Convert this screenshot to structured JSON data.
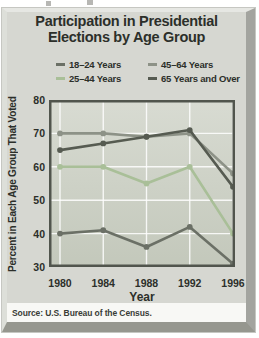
{
  "figure": {
    "title_line1": "Participation in Presidential",
    "title_line2": "Elections by Age Group",
    "source": "Source: U.S. Bureau of the Census.",
    "panel_color": "#d6d7d1",
    "plot_bg_top": "#d8dbd2",
    "plot_bg_bottom": "#c3c8bb",
    "plot_border_color": "#51554d",
    "grid_color": "#ffffff",
    "text_color": "#2c2f2a"
  },
  "legend": {
    "order": [
      0,
      2,
      1,
      3
    ]
  },
  "chart_data": {
    "type": "line",
    "title": "Participation in Presidential Elections by Age Group",
    "x": [
      "1980",
      "1984",
      "1988",
      "1992",
      "1996"
    ],
    "xlabel": "Year",
    "ylabel": "Percent in Each Age Group That Voted",
    "ylim": [
      30,
      80
    ],
    "yticks": [
      30,
      40,
      50,
      60,
      70,
      80
    ],
    "grid": true,
    "legend_position": "top",
    "series": [
      {
        "name": "18–24 Years",
        "color": "#6b7066",
        "values": [
          40,
          41,
          36,
          42,
          31
        ]
      },
      {
        "name": "25–44 Years",
        "color": "#a9bf98",
        "values": [
          60,
          60,
          55,
          60,
          40
        ]
      },
      {
        "name": "45–64 Years",
        "color": "#8d9287",
        "values": [
          70,
          70,
          69,
          70,
          58
        ]
      },
      {
        "name": "65 Years and Over",
        "color": "#565b51",
        "values": [
          65,
          67,
          69,
          71,
          54
        ]
      }
    ]
  }
}
